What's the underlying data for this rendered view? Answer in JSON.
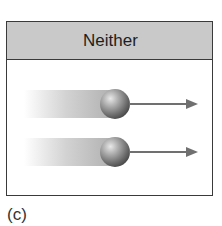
{
  "panel": {
    "header_label": "Neither",
    "header_color": "#c9c9c9",
    "border_color": "#3a3a3a"
  },
  "objects": [
    {
      "name": "ball-1",
      "icon": "sphere",
      "motion": "moving-right",
      "arrow_color": "#707070"
    },
    {
      "name": "ball-2",
      "icon": "sphere",
      "motion": "moving-right",
      "arrow_color": "#707070"
    }
  ],
  "caption": "(c)"
}
